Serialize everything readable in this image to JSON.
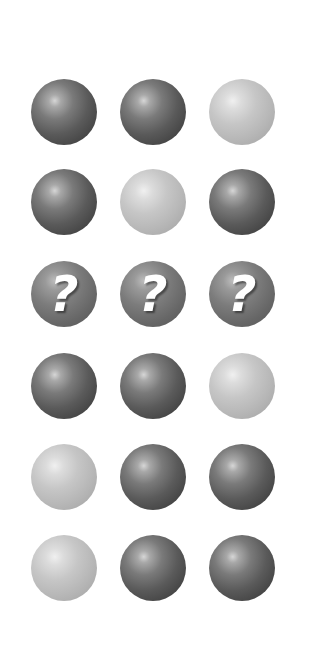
{
  "puzzle": {
    "layout": {
      "columns_x": [
        64,
        153,
        242
      ],
      "rows_y": [
        112,
        202,
        294,
        386,
        477,
        568
      ],
      "diameter": 66
    },
    "colors": {
      "background": "#ffffff",
      "dark_sphere": "#5a5a5a",
      "light_sphere": "#bdbdbd",
      "question_sphere": "#6a6a6a",
      "question_mark": "#ffffff"
    },
    "question_glyph": "?",
    "rows": [
      {
        "cells": [
          "dark",
          "dark",
          "light"
        ]
      },
      {
        "cells": [
          "dark",
          "light",
          "dark"
        ]
      },
      {
        "cells": [
          "question",
          "question",
          "question"
        ]
      },
      {
        "cells": [
          "dark",
          "dark",
          "light"
        ]
      },
      {
        "cells": [
          "light",
          "dark",
          "dark"
        ]
      },
      {
        "cells": [
          "light",
          "dark",
          "dark"
        ]
      }
    ]
  }
}
